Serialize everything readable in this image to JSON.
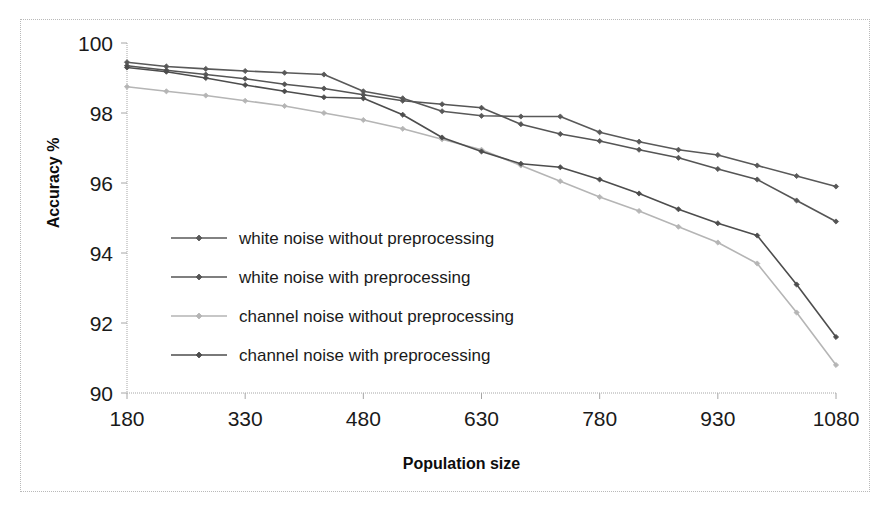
{
  "chart_data": {
    "type": "line",
    "title": "",
    "xlabel": "Population size",
    "ylabel": "Accuracy %",
    "xlim": [
      180,
      1080
    ],
    "ylim": [
      90,
      100
    ],
    "xticks": [
      180,
      330,
      480,
      630,
      780,
      930,
      1080
    ],
    "yticks": [
      90,
      92,
      94,
      96,
      98,
      100
    ],
    "xtick_labels": [
      "180",
      "330",
      "480",
      "630",
      "780",
      "930",
      "1080"
    ],
    "ytick_labels": [
      "90",
      "92",
      "94",
      "96",
      "98",
      "100"
    ],
    "grid": false,
    "legend_position": "inside-left-lower",
    "x": [
      180,
      230,
      280,
      330,
      380,
      430,
      480,
      530,
      580,
      630,
      680,
      730,
      780,
      830,
      880,
      930,
      980,
      1030,
      1080
    ],
    "series": [
      {
        "name": "white noise without preprocessing",
        "color": "#595959",
        "marker": "diamond",
        "values": [
          99.45,
          99.33,
          99.26,
          99.2,
          99.15,
          99.1,
          98.62,
          98.42,
          98.05,
          97.92,
          97.9,
          97.9,
          97.45,
          97.18,
          96.95,
          96.8,
          96.5,
          96.2,
          95.9
        ]
      },
      {
        "name": "white noise with preprocessing",
        "color": "#555555",
        "marker": "diamond",
        "values": [
          99.35,
          99.22,
          99.1,
          98.98,
          98.82,
          98.7,
          98.52,
          98.35,
          98.25,
          98.15,
          97.68,
          97.4,
          97.2,
          96.95,
          96.72,
          96.4,
          96.1,
          95.5,
          94.9
        ]
      },
      {
        "name": "channel noise without preprocessing",
        "color": "#b5b5b5",
        "marker": "diamond",
        "values": [
          98.75,
          98.62,
          98.5,
          98.35,
          98.2,
          98.0,
          97.8,
          97.55,
          97.25,
          96.95,
          96.5,
          96.05,
          95.6,
          95.2,
          94.75,
          94.3,
          93.7,
          92.3,
          90.8
        ]
      },
      {
        "name": "channel noise with preprocessing",
        "color": "#4d4d4d",
        "marker": "diamond",
        "values": [
          99.3,
          99.18,
          99.0,
          98.8,
          98.62,
          98.45,
          98.42,
          97.95,
          97.3,
          96.9,
          96.55,
          96.45,
          96.1,
          95.7,
          95.25,
          94.85,
          94.5,
          93.1,
          91.6
        ]
      }
    ]
  },
  "legend": {
    "items": [
      {
        "label": "white noise without preprocessing",
        "color": "#595959"
      },
      {
        "label": "white noise with preprocessing",
        "color": "#555555"
      },
      {
        "label": "channel noise without preprocessing",
        "color": "#b5b5b5"
      },
      {
        "label": "channel noise with preprocessing",
        "color": "#4d4d4d"
      }
    ]
  },
  "axes": {
    "x_title": "Population size",
    "y_title": "Accuracy %"
  }
}
